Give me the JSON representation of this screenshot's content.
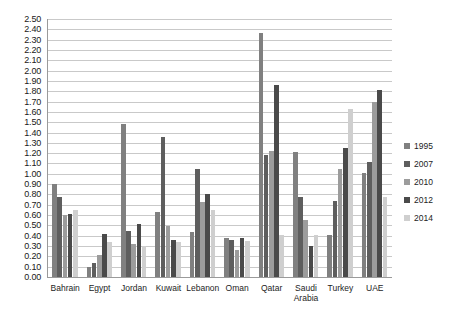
{
  "chart_data": {
    "type": "bar",
    "title": "",
    "subtitle": "",
    "xlabel": "",
    "ylabel": "",
    "ylim": [
      0,
      2.5
    ],
    "ytick_step": 0.1,
    "grid": true,
    "legend_position": "right",
    "categories": [
      "Bahrain",
      "Egypt",
      "Jordan",
      "Kuwait",
      "Lebanon",
      "Oman",
      "Qatar",
      "Saudi Arabia",
      "Turkey",
      "UAE"
    ],
    "ytick_labels": [
      "2.50",
      "2.40",
      "2.30",
      "2.20",
      "2.10",
      "2.00",
      "1.90",
      "1.80",
      "1.70",
      "1.60",
      "1.50",
      "1.40",
      "1.30",
      "1.20",
      "1.10",
      "1.00",
      "0.90",
      "0.80",
      "0.70",
      "0.60",
      "0.50",
      "0.40",
      "0.30",
      "0.20",
      "0.10",
      "0.00"
    ],
    "series": [
      {
        "name": "1995",
        "color": "#808080",
        "values": [
          0.9,
          0.1,
          1.48,
          0.63,
          0.44,
          0.38,
          2.36,
          1.21,
          0.41,
          1.01
        ]
      },
      {
        "name": "2007",
        "color": "#5e5e5e",
        "values": [
          0.78,
          0.14,
          0.45,
          1.36,
          1.05,
          0.36,
          1.18,
          0.78,
          0.74,
          1.11
        ]
      },
      {
        "name": "2010",
        "color": "#9c9c9c",
        "values": [
          0.6,
          0.21,
          0.32,
          0.49,
          0.73,
          0.26,
          1.22,
          0.55,
          1.05,
          1.7
        ]
      },
      {
        "name": "2012",
        "color": "#4a4a4a",
        "values": [
          0.61,
          0.42,
          0.51,
          0.36,
          0.8,
          0.38,
          1.86,
          0.3,
          1.25,
          1.81
        ]
      },
      {
        "name": "2014",
        "color": "#cfcfcf",
        "values": [
          0.65,
          0.34,
          0.3,
          0.34,
          0.65,
          0.35,
          0.41,
          0.41,
          1.63,
          0.78
        ]
      }
    ]
  }
}
